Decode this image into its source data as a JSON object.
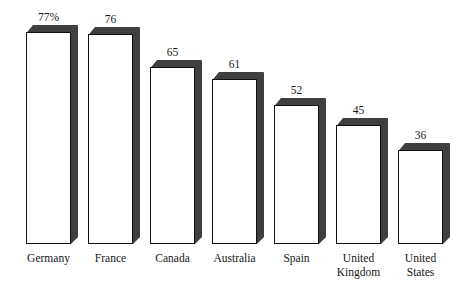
{
  "chart_data": {
    "type": "bar",
    "title": "",
    "subtitle": "",
    "xlabel": "",
    "ylabel": "",
    "categories": [
      "Germany",
      "France",
      "Canada",
      "Australia",
      "United Kingdom",
      "United States"
    ],
    "style": "3d-extruded-column",
    "grid": false,
    "legend": null,
    "ylim": [
      0,
      85
    ],
    "value_unit": "percent",
    "bars": [
      {
        "category": "Germany",
        "label": "Germany",
        "value": 77,
        "value_label": "77%",
        "front_x": 26,
        "front_w": 45,
        "top_y": 25,
        "depth": 7
      },
      {
        "category": "France",
        "label": "France",
        "value": 76,
        "value_label": "76",
        "front_x": 88,
        "front_w": 45,
        "top_y": 27,
        "depth": 7
      },
      {
        "category": "Canada",
        "label": "Canada",
        "value": 65,
        "value_label": "65",
        "front_x": 150,
        "front_w": 45,
        "top_y": 60,
        "depth": 7
      },
      {
        "category": "Australia",
        "label": "Australia",
        "value": 61,
        "value_label": "61",
        "front_x": 212,
        "front_w": 45,
        "top_y": 72,
        "depth": 7
      },
      {
        "category": "Spain",
        "label": "Spain",
        "value": 52,
        "value_label": "52",
        "front_x": 274,
        "front_w": 45,
        "top_y": 98,
        "depth": 7
      },
      {
        "category": "United Kingdom",
        "label": "United\nKingdom",
        "value": 45,
        "value_label": "45",
        "front_x": 336,
        "front_w": 45,
        "top_y": 118,
        "depth": 7
      },
      {
        "category": "United States",
        "label": "United\nStates",
        "value": 36,
        "value_label": "36",
        "front_x": 398,
        "front_w": 45,
        "top_y": 143,
        "depth": 7
      }
    ],
    "baseline_y": 244,
    "colors": {
      "bar_face": "#ffffff",
      "bar_outline": "#111111",
      "bar_shade": "#3f3f3f",
      "text": "#171717",
      "background": "#ffffff"
    }
  }
}
